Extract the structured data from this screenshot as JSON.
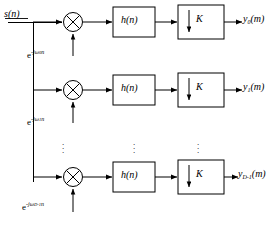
{
  "diagram": {
    "input": {
      "label": "s(n)",
      "name": "input-signal"
    },
    "branches": [
      {
        "index": 0,
        "modulator_label": "e",
        "modulator_exponent": "-jω",
        "modulator_subscript": "0",
        "modulator_exponent_tail": "n",
        "filter_label": "h(n)",
        "downsampler_label": "K",
        "downsampler_arrow": "↓",
        "output_base": "y",
        "output_subscript": "0",
        "output_arg": "(m)"
      },
      {
        "index": 1,
        "modulator_label": "e",
        "modulator_exponent": "-jω",
        "modulator_subscript": "1",
        "modulator_exponent_tail": "n",
        "filter_label": "h(n)",
        "downsampler_label": "K",
        "downsampler_arrow": "↓",
        "output_base": "y",
        "output_subscript": "1",
        "output_arg": "(m)"
      },
      {
        "index": 2,
        "modulator_label": "e",
        "modulator_exponent": "-jω",
        "modulator_subscript": "D-1",
        "modulator_exponent_tail": "n",
        "filter_label": "h(n)",
        "downsampler_label": "K",
        "downsampler_arrow": "↓",
        "output_base": "y",
        "output_subscript": "D-1",
        "output_arg": "(m)"
      }
    ],
    "ellipsis": {
      "glyph": "⋮",
      "columns": [
        "multiplier-column",
        "filter-column",
        "downsampler-column"
      ]
    },
    "multiplier_glyph": "×",
    "colors": {
      "stroke": "#000000",
      "background": "#ffffff",
      "text": "#000000"
    }
  }
}
